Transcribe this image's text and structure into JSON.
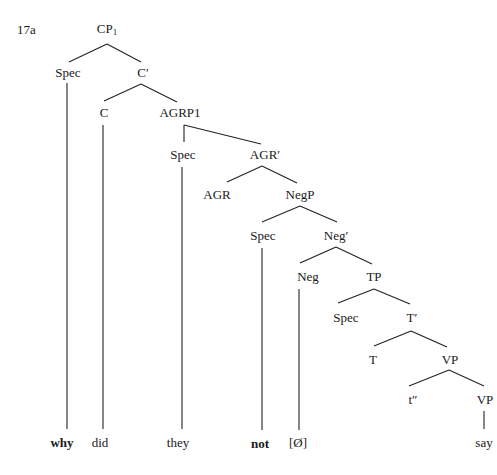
{
  "example_number": "17a",
  "nodes": {
    "cp1": {
      "label": "CP",
      "sub": "1"
    },
    "cp_spec": "Spec",
    "c_bar": "C′",
    "c": "C",
    "agrp1": "AGRP1",
    "agrp_spec": "Spec",
    "agr_bar": "AGR′",
    "agr": "AGR",
    "negp": "NegP",
    "negp_spec": "Spec",
    "neg_bar": "Neg′",
    "neg": "Neg",
    "tp": "TP",
    "tp_spec": "Spec",
    "t_bar": "T′",
    "t": "T",
    "vp": "VP",
    "trace": "t″",
    "vp_lower": "VP"
  },
  "words": {
    "why": "why",
    "did": "did",
    "they": "they",
    "not": "not",
    "null_neg": "[Ø]",
    "say": "say"
  }
}
